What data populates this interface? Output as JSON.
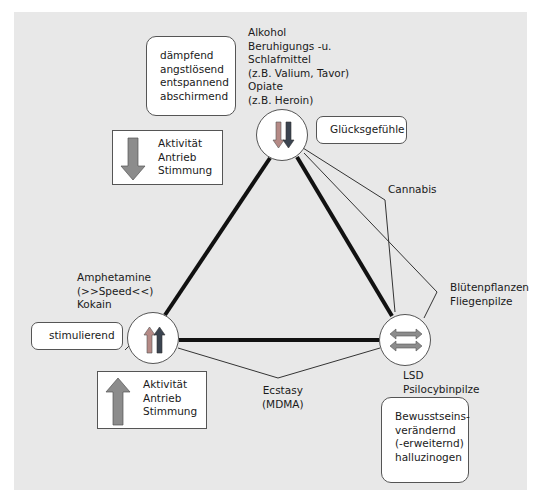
{
  "diagram": {
    "colors": {
      "panel": "#e8e8e8",
      "thick_line": "#111111",
      "thin_line": "#333333",
      "arrow_light": "#b58a86",
      "arrow_dark": "#3b4450",
      "arrow_gray": "#8c8c8c"
    },
    "top_node": {
      "icon": "double-down-arrows",
      "substances": "Alkohol\nBeruhigungs -u.\nSchlafmittel\n(z.B. Valium, Tavor)\nOpiate\n(z.B. Heroin)",
      "effects_box": "dämpfend\nangstlösend\nentspannend\nabschirmend",
      "extra_box": "Glücksgefühle",
      "level_box": {
        "icon": "down-arrow",
        "text": "Aktivität\nAntrieb\nStimmung"
      }
    },
    "left_node": {
      "icon": "double-up-arrows",
      "substances": "Amphetamine\n(>>Speed<<)\nKokain",
      "effects_box": "stimulierend",
      "level_box": {
        "icon": "up-arrow",
        "text": "Aktivität\nAntrieb\nStimmung"
      }
    },
    "right_node": {
      "icon": "double-horizontal-arrows",
      "substances": "LSD\nPsilocybinpilze",
      "effects_box": "Bewusstseins-\nverändernd\n(-erweiternd)\nhalluzinogen"
    },
    "edge_labels": {
      "cannabis": "Cannabis",
      "bluetenpflanzen": "Blütenpflanzen\nFliegenpilze",
      "ecstasy": "Ecstasy\n(MDMA)"
    }
  }
}
